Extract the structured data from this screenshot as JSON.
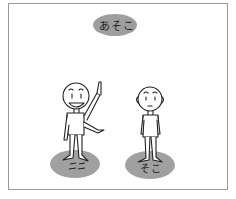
{
  "illustration": {
    "top_label": "あそこ",
    "left_ground_label": "ここ",
    "right_ground_label": "そこ",
    "colors": {
      "bubble": "#9e9e9e",
      "ground": "#a0a0a0",
      "ink": "#222222",
      "frame": "#9a9a9a"
    },
    "figures": [
      {
        "name": "speaker",
        "pose": "pointing up and to the side",
        "expression": "smiling"
      },
      {
        "name": "listener",
        "pose": "standing",
        "expression": "neutral"
      }
    ]
  }
}
